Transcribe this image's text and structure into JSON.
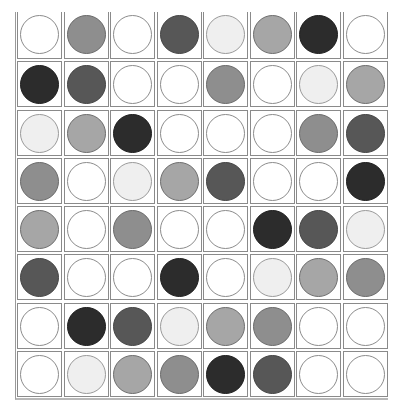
{
  "board": {
    "rows": 8,
    "cols": 8,
    "shades": {
      "white": "#ffffff",
      "light": "#efefef",
      "medium-light": "#a6a6a6",
      "medium": "#8e8e8e",
      "dark": "#575757",
      "darkest": "#2c2c2c"
    },
    "outline": {
      "white": "#8c8c8c",
      "light": "#9a9a9a",
      "medium-light": "#6e6e6e",
      "medium": "#6a6a6a",
      "dark": "#444444",
      "darkest": "#1e1e1e"
    },
    "grid": [
      [
        "white",
        "medium",
        "white",
        "dark",
        "light",
        "medium-light",
        "darkest",
        "white"
      ],
      [
        "darkest",
        "dark",
        "white",
        "white",
        "medium",
        "white",
        "light",
        "medium-light"
      ],
      [
        "light",
        "medium-light",
        "darkest",
        "white",
        "white",
        "white",
        "medium",
        "dark"
      ],
      [
        "medium",
        "white",
        "light",
        "medium-light",
        "dark",
        "white",
        "white",
        "darkest"
      ],
      [
        "medium-light",
        "white",
        "medium",
        "white",
        "white",
        "darkest",
        "dark",
        "light"
      ],
      [
        "dark",
        "white",
        "white",
        "darkest",
        "white",
        "light",
        "medium-light",
        "medium"
      ],
      [
        "white",
        "darkest",
        "dark",
        "light",
        "medium-light",
        "medium",
        "white",
        "white"
      ],
      [
        "white",
        "light",
        "medium-light",
        "medium",
        "darkest",
        "dark",
        "white",
        "white"
      ]
    ]
  }
}
